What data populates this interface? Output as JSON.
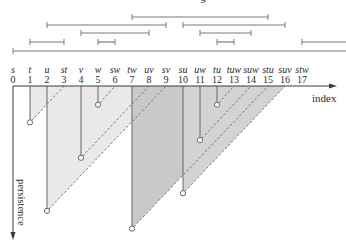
{
  "figure": {
    "top_fragment": "g",
    "x_axis_label": "index",
    "y_axis_label": "persistence"
  },
  "colors": {
    "axis": "#3a3a3a",
    "bar": "#7a7a7a",
    "persistence_line": "#666666",
    "dashed": "#777777",
    "dim0_fill": "#e9e9e9",
    "dim1_fill": "#d3d3d3",
    "dim1_fill_dark": "#c9c9c9"
  },
  "chart_data": {
    "type": "bar",
    "subtype": "persistence-barcode-with-pairing-triangles",
    "xlabel": "index",
    "ylabel": "persistence",
    "index_ticks": [
      0,
      1,
      2,
      3,
      4,
      5,
      6,
      7,
      8,
      9,
      10,
      11,
      12,
      13,
      14,
      15,
      16,
      17
    ],
    "simplices": [
      "s",
      "t",
      "u",
      "st",
      "v",
      "w",
      "sw",
      "tw",
      "uv",
      "sv",
      "su",
      "uw",
      "tu",
      "tuw",
      "suw",
      "stu",
      "suv",
      "stw"
    ],
    "pairs": [
      {
        "birth": 2,
        "death": 9,
        "birth_simplex": "u",
        "death_simplex": "sv",
        "dim": 0,
        "fill": "#e9e9e9"
      },
      {
        "birth": 1,
        "death": 3,
        "birth_simplex": "t",
        "death_simplex": "st",
        "dim": 0,
        "fill": "#e9e9e9"
      },
      {
        "birth": 4,
        "death": 8,
        "birth_simplex": "v",
        "death_simplex": "uv",
        "dim": 0,
        "fill": "#e9e9e9"
      },
      {
        "birth": 5,
        "death": 6,
        "birth_simplex": "w",
        "death_simplex": "sw",
        "dim": 0,
        "fill": "#e9e9e9"
      },
      {
        "birth": 7,
        "death": 15,
        "birth_simplex": "tw",
        "death_simplex": "stu",
        "dim": 1,
        "fill": "#c9c9c9"
      },
      {
        "birth": 10,
        "death": 16,
        "birth_simplex": "su",
        "death_simplex": "suv",
        "dim": 1,
        "fill": "#d3d3d3"
      },
      {
        "birth": 11,
        "death": 14,
        "birth_simplex": "uw",
        "death_simplex": "suw",
        "dim": 1,
        "fill": "#d3d3d3"
      },
      {
        "birth": 12,
        "death": 13,
        "birth_simplex": "tu",
        "death_simplex": "tuw",
        "dim": 1,
        "fill": "#d3d3d3"
      }
    ],
    "essential": [
      {
        "birth": 0,
        "simplex": "s"
      },
      {
        "birth": 17,
        "simplex": "stw"
      }
    ],
    "bars": [
      {
        "row": 0,
        "start": 7,
        "end": 15
      },
      {
        "row": 1,
        "start": 2,
        "end": 9
      },
      {
        "row": 1,
        "start": 10,
        "end": 16
      },
      {
        "row": 2,
        "start": 4,
        "end": 8
      },
      {
        "row": 2,
        "start": 11,
        "end": 14
      },
      {
        "row": 3,
        "start": 1,
        "end": 3
      },
      {
        "row": 3,
        "start": 5,
        "end": 6
      },
      {
        "row": 3,
        "start": 12,
        "end": 13
      },
      {
        "row": 3,
        "start": 17,
        "end": null
      },
      {
        "row": 4,
        "start": 0,
        "end": null
      }
    ]
  }
}
